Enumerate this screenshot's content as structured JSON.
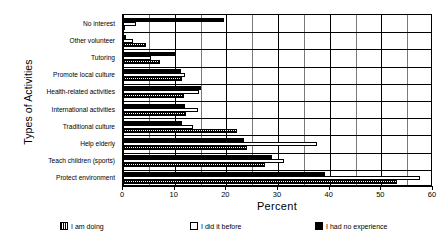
{
  "chart_data": {
    "type": "bar",
    "orientation": "horizontal",
    "title": "",
    "xlabel": "Percent",
    "ylabel": "Types of Activities",
    "xlim": [
      0,
      60
    ],
    "xticks": [
      0,
      10,
      20,
      30,
      40,
      50,
      60
    ],
    "xtick_labels": [
      "0",
      "10",
      "20",
      "30",
      "40",
      "50",
      "60"
    ],
    "minor_tick_step": 5,
    "grid": "vertical-and-horizontal",
    "legend_position": "bottom",
    "categories": [
      "No interest",
      "Other volunteer",
      "Tutoring",
      "Promote local culture",
      "Health-related activities",
      "International activities",
      "Traditional culture",
      "Help elderly",
      "Teach children (sports)",
      "Protect environment"
    ],
    "series": [
      {
        "name": "I had no experience",
        "style": "black",
        "color": "#000000",
        "values": [
          19.5,
          0.6,
          10.0,
          11.2,
          15.0,
          12.0,
          11.5,
          23.5,
          28.8,
          39.0
        ]
      },
      {
        "name": "I did it before",
        "style": "white",
        "color": "#ffffff",
        "values": [
          2.5,
          2.0,
          5.5,
          12.0,
          14.8,
          14.5,
          13.5,
          37.5,
          31.2,
          57.5
        ]
      },
      {
        "name": "I am doing",
        "style": "hatch",
        "color": "#000000",
        "values": [
          0.4,
          4.5,
          7.2,
          11.5,
          11.8,
          12.2,
          22.0,
          24.0,
          27.5,
          53.0
        ]
      }
    ]
  },
  "legend": {
    "items": [
      {
        "label": "I am doing",
        "style": "hatch"
      },
      {
        "label": "I did it before",
        "style": "white"
      },
      {
        "label": "I had no experience",
        "style": "black"
      }
    ]
  }
}
